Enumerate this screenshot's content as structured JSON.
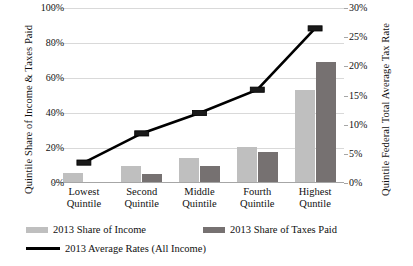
{
  "chart_data": {
    "type": "bar",
    "title": "",
    "xlabel": "",
    "ylabel": "Quintile Share of Income & Taxes Paid",
    "y2label": "Quintile Federal Total Average Tax Rate",
    "categories": [
      "Lowest Quintile",
      "Second Quintile",
      "Middle Quintile",
      "Fourth Quintile",
      "Highest Quintile"
    ],
    "category_lines": [
      [
        "Lowest",
        "Quintile"
      ],
      [
        "Second",
        "Quintile"
      ],
      [
        "Middle",
        "Quintile"
      ],
      [
        "Fourth",
        "Quintile"
      ],
      [
        "Highest",
        "Quntile"
      ]
    ],
    "ylim": [
      0,
      100
    ],
    "y2lim": [
      0,
      30
    ],
    "yticks": [
      0,
      20,
      40,
      60,
      80,
      100
    ],
    "ytick_labels": [
      "0%",
      "20%",
      "40%",
      "60%",
      "80%",
      "100%"
    ],
    "y2ticks": [
      0,
      5,
      10,
      15,
      20,
      25,
      30
    ],
    "y2tick_labels": [
      "0%",
      "5%",
      "10%",
      "15%",
      "20%",
      "25%",
      "30%"
    ],
    "grid": true,
    "legend_position": "bottom",
    "series": [
      {
        "name": "2013 Share of Income",
        "type": "bar",
        "axis": "left",
        "color": "#bfbfbf",
        "values": [
          5.5,
          10.0,
          14.5,
          20.5,
          53.0
        ]
      },
      {
        "name": "2013 Share of Taxes Paid",
        "type": "bar",
        "axis": "left",
        "color": "#767171",
        "values": [
          0.8,
          5.0,
          9.5,
          17.5,
          69.0
        ]
      },
      {
        "name": "2013 Average Rates (All Income)",
        "type": "line",
        "axis": "right",
        "color": "#000000",
        "values": [
          3.5,
          8.5,
          12.0,
          16.0,
          26.5
        ]
      }
    ]
  },
  "axes": {
    "left_title": "Quintile Share of Income & Taxes Paid",
    "right_title": "Quintile Federal Total Average Tax Rate"
  },
  "legend": {
    "items": [
      {
        "label": "2013 Share of Income",
        "marker": "swatch-light"
      },
      {
        "label": "2013 Share of Taxes Paid",
        "marker": "swatch-dark"
      },
      {
        "label": "2013 Average Rates (All Income)",
        "marker": "line-black"
      }
    ]
  }
}
